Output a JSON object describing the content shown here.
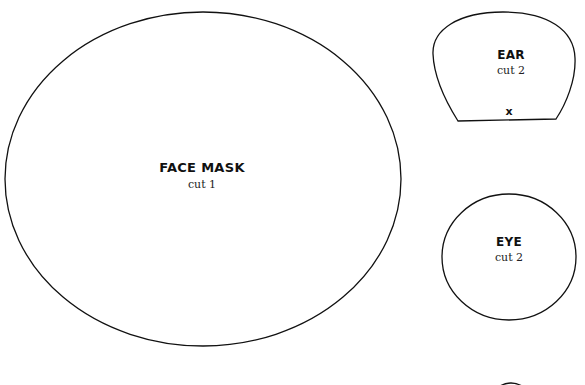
{
  "pieces": {
    "face_mask": {
      "name": "FACE MASK",
      "instruction": "cut 1"
    },
    "ear": {
      "name": "EAR",
      "instruction": "cut 2",
      "fold_mark": "x"
    },
    "eye": {
      "name": "EYE",
      "instruction": "cut 2"
    }
  },
  "colors": {
    "outline": "#111111",
    "background": "#ffffff"
  }
}
